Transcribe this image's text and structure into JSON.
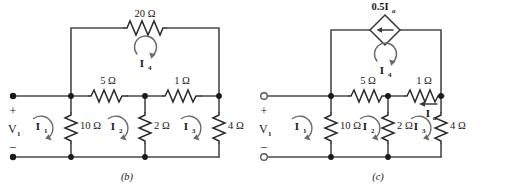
{
  "figure": {
    "type": "circuit-diagram-pair",
    "ohm": "Ω"
  },
  "circuit_b": {
    "caption": "(b)",
    "terminal_style": "filled-dot",
    "source_label": "V",
    "source_sub": "1",
    "plus_sign": "+",
    "minus_sign": "–",
    "resistors": [
      {
        "name": "r20",
        "label": "20 Ω",
        "value": 20,
        "unit": "Ω",
        "orientation": "horizontal",
        "branch": "top"
      },
      {
        "name": "r5",
        "label": "5 Ω",
        "value": 5,
        "unit": "Ω",
        "orientation": "horizontal",
        "branch": "middle-left"
      },
      {
        "name": "r1",
        "label": "1 Ω",
        "value": 1,
        "unit": "Ω",
        "orientation": "horizontal",
        "branch": "middle-right"
      },
      {
        "name": "r10",
        "label": "10 Ω",
        "value": 10,
        "unit": "Ω",
        "orientation": "vertical",
        "branch": "shunt-1"
      },
      {
        "name": "r2",
        "label": "2 Ω",
        "value": 2,
        "unit": "Ω",
        "orientation": "vertical",
        "branch": "shunt-2"
      },
      {
        "name": "r4",
        "label": "4 Ω",
        "value": 4,
        "unit": "Ω",
        "orientation": "vertical",
        "branch": "shunt-3"
      }
    ],
    "mesh_currents": [
      {
        "name": "I1",
        "symbol": "I",
        "sub": "1",
        "direction": "clockwise"
      },
      {
        "name": "I2",
        "symbol": "I",
        "sub": "2",
        "direction": "clockwise"
      },
      {
        "name": "I3",
        "symbol": "I",
        "sub": "3",
        "direction": "clockwise"
      },
      {
        "name": "I4",
        "symbol": "I",
        "sub": "4",
        "direction": "clockwise"
      }
    ]
  },
  "circuit_c": {
    "caption": "(c)",
    "terminal_style": "open-circle",
    "source_label": "V",
    "source_sub": "1",
    "plus_sign": "+",
    "minus_sign": "–",
    "dependent_source": {
      "name": "dependent-current-source",
      "label": "0.5I",
      "sub": "a",
      "gain": 0.5,
      "control": "Ia",
      "shape": "diamond",
      "arrow_direction": "left"
    },
    "control_current": {
      "name": "Ia",
      "symbol": "I",
      "sub": "a",
      "arrow_direction": "left"
    },
    "resistors": [
      {
        "name": "r5",
        "label": "5 Ω",
        "value": 5,
        "unit": "Ω",
        "orientation": "horizontal",
        "branch": "middle-left"
      },
      {
        "name": "r1",
        "label": "1 Ω",
        "value": 1,
        "unit": "Ω",
        "orientation": "horizontal",
        "branch": "middle-right"
      },
      {
        "name": "r10",
        "label": "10 Ω",
        "value": 10,
        "unit": "Ω",
        "orientation": "vertical",
        "branch": "shunt-1"
      },
      {
        "name": "r2",
        "label": "2 Ω",
        "value": 2,
        "unit": "Ω",
        "orientation": "vertical",
        "branch": "shunt-2"
      },
      {
        "name": "r4",
        "label": "4 Ω",
        "value": 4,
        "unit": "Ω",
        "orientation": "vertical",
        "branch": "shunt-3"
      }
    ],
    "mesh_currents": [
      {
        "name": "I1",
        "symbol": "I",
        "sub": "1",
        "direction": "clockwise"
      },
      {
        "name": "I2",
        "symbol": "I",
        "sub": "2",
        "direction": "clockwise"
      },
      {
        "name": "I3",
        "symbol": "I",
        "sub": "3",
        "direction": "clockwise"
      },
      {
        "name": "I4",
        "symbol": "I",
        "sub": "4",
        "direction": "clockwise"
      }
    ]
  }
}
